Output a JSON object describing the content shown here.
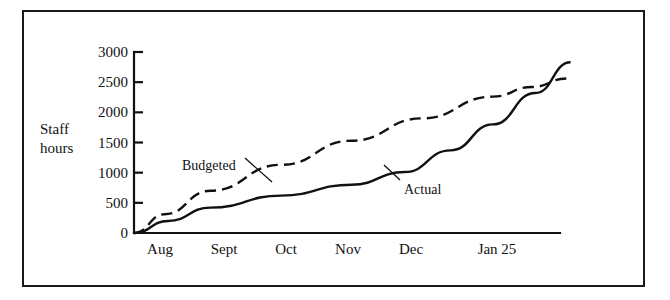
{
  "chart_data": {
    "type": "line",
    "title": "",
    "xlabel": "",
    "ylabel": "Staff hours",
    "ylabel_line1": "Staff",
    "ylabel_line2": "hours",
    "categories": [
      "Aug",
      "Sept",
      "Oct",
      "Nov",
      "Dec",
      "Jan 25"
    ],
    "x": [
      0,
      1,
      2,
      3,
      4,
      5
    ],
    "ylim": [
      0,
      3000
    ],
    "xlim": [
      -0.08,
      5.95
    ],
    "yticks": [
      0,
      500,
      1000,
      1500,
      2000,
      2500,
      3000
    ],
    "ytick_labels": [
      "0",
      "500",
      "1000",
      "1500",
      "2000",
      "2500",
      "3000"
    ],
    "grid": false,
    "legend": "inline-annotations",
    "series": [
      {
        "name": "Budgeted",
        "style": "dashed",
        "color": "#111111",
        "x": [
          -0.08,
          0.35,
          1.0,
          2.0,
          3.0,
          4.0,
          5.0,
          5.55,
          6.05
        ],
        "values": [
          0,
          310,
          700,
          1130,
          1530,
          1900,
          2260,
          2420,
          2560
        ]
      },
      {
        "name": "Actual",
        "style": "solid",
        "color": "#111111",
        "x": [
          -0.08,
          0.4,
          1.0,
          2.0,
          3.0,
          3.75,
          4.4,
          5.0,
          5.6,
          6.1
        ],
        "values": [
          0,
          200,
          420,
          620,
          800,
          1010,
          1370,
          1800,
          2320,
          2830
        ]
      }
    ],
    "annotations": [
      {
        "text": "Budgeted",
        "label_x": 182,
        "label_y": 159,
        "leader_from_x": 245,
        "leader_from_y": 158,
        "leader_to_x": 272,
        "leader_to_y": 182
      },
      {
        "text": "Actual",
        "label_x": 404,
        "label_y": 183,
        "leader_from_x": 400,
        "leader_from_y": 180,
        "leader_to_x": 384,
        "leader_to_y": 165
      }
    ],
    "axis_color": "#111111",
    "background": "#ffffff",
    "border_color": "#1a1a1a"
  }
}
